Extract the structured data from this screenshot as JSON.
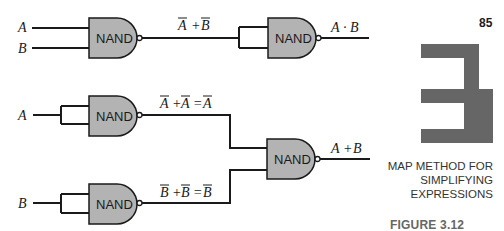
{
  "page": {
    "number": "85",
    "chapter_number_glyph": "3",
    "chapter_title_lines": [
      "MAP METHOD FOR",
      "SIMPLIFYING",
      "EXPRESSIONS"
    ],
    "figure_label": "FIGURE 3.12"
  },
  "colors": {
    "gate_fill": "#b3b3b3",
    "chapter_block": "#666666",
    "wire": "#1a1a1a",
    "figure_label": "#666666"
  },
  "circuits": {
    "top": {
      "inputs": [
        "A",
        "B"
      ],
      "gate1": {
        "label": "NAND",
        "output_expr": "Ā + B̄"
      },
      "gate2": {
        "label": "NAND",
        "output_expr": "A · B"
      }
    },
    "bottom": {
      "gate_a": {
        "label": "NAND",
        "input": "A",
        "output_expr": "Ā + Ā = Ā"
      },
      "gate_b": {
        "label": "NAND",
        "input": "B",
        "output_expr": "B̄ + B̄ = B̄"
      },
      "gate_out": {
        "label": "NAND",
        "output_expr": "A + B"
      }
    }
  },
  "labels": {
    "top_in_a": "A",
    "top_in_b": "B",
    "top_g1_out_a": "A",
    "top_g1_plus": "+",
    "top_g1_out_b": "B",
    "top_g2_out_a": "A",
    "top_g2_dot": "·",
    "top_g2_out_b": "B",
    "bot_in_a": "A",
    "bot_in_b": "B",
    "bot_ga_t1": "A",
    "bot_ga_plus": "+",
    "bot_ga_t2": "A",
    "bot_ga_eq": "=",
    "bot_ga_t3": "A",
    "bot_gb_t1": "B",
    "bot_gb_plus": "+",
    "bot_gb_t2": "B",
    "bot_gb_eq": "=",
    "bot_gb_t3": "B",
    "bot_out_a": "A",
    "bot_out_plus": "+",
    "bot_out_b": "B",
    "nand": "NAND"
  }
}
